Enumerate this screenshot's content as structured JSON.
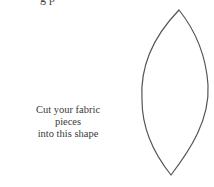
{
  "document": {
    "top_cutoff_text": "g                                   p",
    "caption_line1": "Cut your fabric pieces",
    "caption_line2": "into this shape",
    "illustration": "lens-shape-outline",
    "stroke_color": "#555555"
  }
}
